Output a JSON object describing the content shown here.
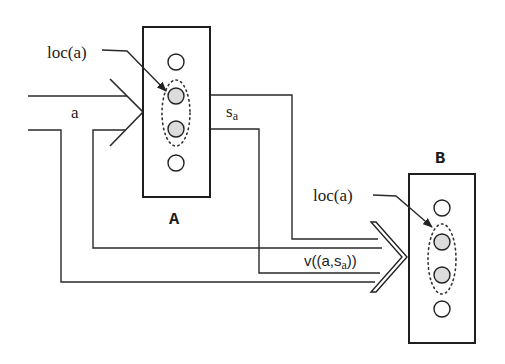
{
  "diagram": {
    "type": "architecture/flow",
    "nodes": [
      {
        "id": "A",
        "label": "A",
        "slots": 4,
        "highlighted_slots": [
          2,
          3
        ],
        "annotation": "loc(a)"
      },
      {
        "id": "B",
        "label": "B",
        "slots": 4,
        "highlighted_slots": [
          2,
          3
        ],
        "annotation": "loc(a)"
      }
    ],
    "edges": [
      {
        "from": "input",
        "to": "A",
        "label": "a"
      },
      {
        "from": "A",
        "to": "B",
        "label": "s_a"
      },
      {
        "from": "input+A",
        "to": "B",
        "label": "v((a,s_a))"
      }
    ]
  },
  "labels": {
    "box_a": "A",
    "box_b": "B",
    "loc_a_left": "loc(a)",
    "loc_a_right": "loc(a)",
    "input_a": "a",
    "state_s": "s",
    "state_sub": "a",
    "value_prefix": "v((a,s",
    "value_sub": "a",
    "value_suffix": "))"
  },
  "colors": {
    "line": "#2a2a2a",
    "slot_fill": "#ffffff",
    "highlight_fill": "#dcdcdc"
  }
}
